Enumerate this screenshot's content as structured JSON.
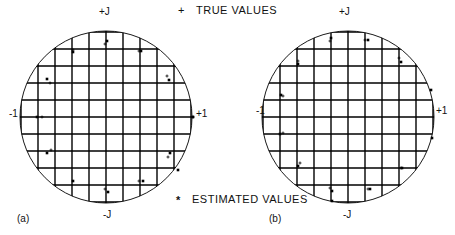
{
  "figure": {
    "legend": {
      "true_values": {
        "marker": "+",
        "label": "TRUE VALUES"
      },
      "estimated_values": {
        "marker": "*",
        "label": "ESTIMATED VALUES"
      }
    },
    "panels": [
      {
        "id": "a",
        "caption": "(a)",
        "axis_labels": {
          "top": "+J",
          "bottom": "-J",
          "left": "-1",
          "right": "+1"
        },
        "center": [
          106,
          117
        ],
        "radius": 86,
        "grid_spacing": 17,
        "true_points": [
          [
            105,
            44
          ],
          [
            73,
            50
          ],
          [
            139,
            51
          ],
          [
            50,
            83
          ],
          [
            167,
            76
          ],
          [
            42,
            117
          ],
          [
            193,
            117
          ],
          [
            51,
            150
          ],
          [
            168,
            157
          ],
          [
            105,
            189
          ],
          [
            139,
            181
          ]
        ],
        "estimated_points": [
          [
            107,
            41
          ],
          [
            73,
            52
          ],
          [
            141,
            51
          ],
          [
            47,
            79
          ],
          [
            169,
            80
          ],
          [
            37,
            117
          ],
          [
            193,
            117
          ],
          [
            47,
            153
          ],
          [
            170,
            153
          ],
          [
            178,
            170
          ],
          [
            73,
            181
          ],
          [
            108,
            192
          ],
          [
            143,
            181
          ]
        ]
      },
      {
        "id": "b",
        "caption": "(b)",
        "axis_labels": {
          "top": "+J",
          "bottom": "-J",
          "left": "-1",
          "right": "+1"
        },
        "center": [
          348,
          117
        ],
        "radius": 86,
        "grid_spacing": 17,
        "true_points": [
          [
            330,
            41
          ],
          [
            365,
            40
          ],
          [
            298,
            61
          ],
          [
            399,
            58
          ],
          [
            283,
            96
          ],
          [
            283,
            133
          ],
          [
            300,
            163
          ],
          [
            401,
            168
          ],
          [
            330,
            188
          ],
          [
            368,
            189
          ]
        ],
        "estimated_points": [
          [
            331,
            38
          ],
          [
            368,
            40
          ],
          [
            298,
            64
          ],
          [
            401,
            62
          ],
          [
            281,
            95
          ],
          [
            431,
            90
          ],
          [
            280,
            134
          ],
          [
            432,
            138
          ],
          [
            298,
            166
          ],
          [
            402,
            168
          ],
          [
            332,
            191
          ],
          [
            370,
            189
          ],
          [
            332,
            201
          ]
        ]
      }
    ]
  }
}
